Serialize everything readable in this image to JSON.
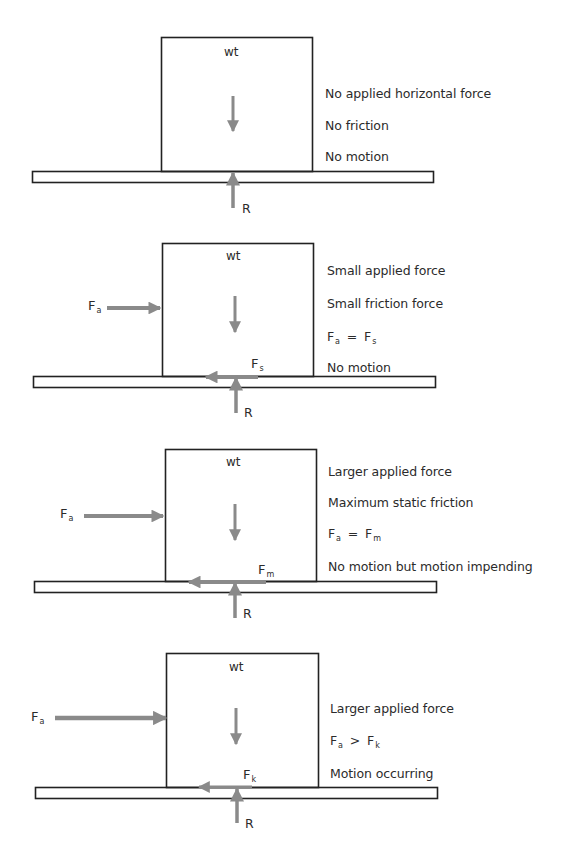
{
  "figure": {
    "colors": {
      "outline": "#222222",
      "force_arrow": "#8a8a8a",
      "text": "#2b2b2b"
    },
    "panels": [
      {
        "id": "panel-1",
        "block_label": "wt",
        "reaction_label": "R",
        "applied_force": null,
        "friction_force": null,
        "notes": [
          "No applied horizontal force",
          "No friction",
          "No motion"
        ]
      },
      {
        "id": "panel-2",
        "block_label": "wt",
        "reaction_label": "R",
        "applied_force": {
          "symbol": "F",
          "sub": "a"
        },
        "friction_force": {
          "symbol": "F",
          "sub": "s"
        },
        "notes": [
          "Small applied force",
          "Small friction force",
          "Fa = Fs",
          "No motion"
        ],
        "equation": {
          "lhs": "F",
          "lhs_sub": "a",
          "op": "=",
          "rhs": "F",
          "rhs_sub": "s"
        }
      },
      {
        "id": "panel-3",
        "block_label": "wt",
        "reaction_label": "R",
        "applied_force": {
          "symbol": "F",
          "sub": "a"
        },
        "friction_force": {
          "symbol": "F",
          "sub": "m"
        },
        "notes": [
          "Larger applied force",
          "Maximum static friction",
          "Fa = Fm",
          "No motion but motion impending"
        ],
        "equation": {
          "lhs": "F",
          "lhs_sub": "a",
          "op": "=",
          "rhs": "F",
          "rhs_sub": "m"
        }
      },
      {
        "id": "panel-4",
        "block_label": "wt",
        "reaction_label": "R",
        "applied_force": {
          "symbol": "F",
          "sub": "a"
        },
        "friction_force": {
          "symbol": "F",
          "sub": "k"
        },
        "notes": [
          "Larger applied force",
          "Fa > Fk",
          "Motion occurring"
        ],
        "equation": {
          "lhs": "F",
          "lhs_sub": "a",
          "op": ">",
          "rhs": "F",
          "rhs_sub": "k"
        }
      }
    ]
  }
}
